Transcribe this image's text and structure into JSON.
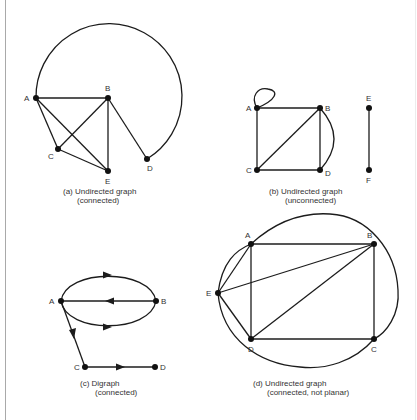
{
  "figures": {
    "a": {
      "caption_line1": "(a)  Undirected graph",
      "caption_line2": "(connected)",
      "nodes": {
        "A": "A",
        "B": "B",
        "C": "C",
        "D": "D",
        "E": "E"
      },
      "edges": [
        [
          "A",
          "B"
        ],
        [
          "A",
          "C"
        ],
        [
          "A",
          "E"
        ],
        [
          "B",
          "C"
        ],
        [
          "B",
          "E"
        ],
        [
          "B",
          "D"
        ],
        [
          "C",
          "E"
        ],
        [
          "A",
          "D",
          "arc"
        ]
      ]
    },
    "b": {
      "caption_line1": "(b)  Undirected graph",
      "caption_line2": "(unconnected)",
      "nodes": {
        "A": "A",
        "B": "B",
        "C": "C",
        "D": "D",
        "E": "E",
        "F": "F"
      },
      "edges": [
        [
          "A",
          "A",
          "loop"
        ],
        [
          "A",
          "B"
        ],
        [
          "A",
          "C"
        ],
        [
          "B",
          "C"
        ],
        [
          "B",
          "D"
        ],
        [
          "B",
          "D",
          "arc"
        ],
        [
          "C",
          "D"
        ],
        [
          "E",
          "F"
        ]
      ]
    },
    "c": {
      "caption_line1": "(c)  Digraph",
      "caption_line2": "(connected)",
      "nodes": {
        "A": "A",
        "B": "B",
        "C": "C",
        "D": "D"
      },
      "edges": [
        [
          "A",
          "B",
          "upper-arc"
        ],
        [
          "B",
          "A",
          "straight"
        ],
        [
          "A",
          "B",
          "lower-arc"
        ],
        [
          "A",
          "C"
        ],
        [
          "C",
          "D"
        ]
      ]
    },
    "d": {
      "caption_line1": "(d)  Undirected graph",
      "caption_line2": "(connected, not planar)",
      "nodes": {
        "A": "A",
        "B": "B",
        "C": "C",
        "D": "D",
        "E": "E"
      },
      "edges": [
        [
          "A",
          "B"
        ],
        [
          "A",
          "D"
        ],
        [
          "A",
          "E"
        ],
        [
          "B",
          "C"
        ],
        [
          "B",
          "D"
        ],
        [
          "B",
          "E"
        ],
        [
          "C",
          "D"
        ],
        [
          "D",
          "E"
        ],
        [
          "E",
          "B",
          "outer-arc-top"
        ],
        [
          "E",
          "C",
          "outer-arc-bottom"
        ]
      ]
    }
  }
}
